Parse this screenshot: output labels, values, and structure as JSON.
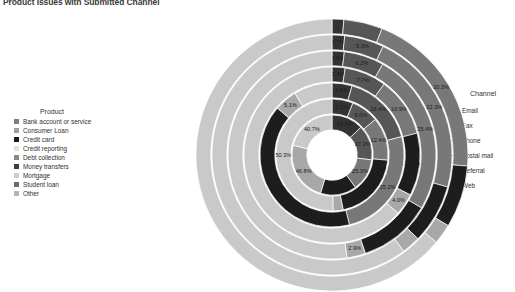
{
  "title": "Product Issues with Submitted Channel",
  "product_legend": {
    "header": "Product",
    "items": [
      {
        "label": "Bank account or service",
        "color": "#7c7c7c"
      },
      {
        "label": "Consumer Loan",
        "color": "#9e9e9e"
      },
      {
        "label": "Credit card",
        "color": "#1a1a1a"
      },
      {
        "label": "Credit reporting",
        "color": "#e2e2e2"
      },
      {
        "label": "Debt collection",
        "color": "#8a8a8a"
      },
      {
        "label": "Money transfers",
        "color": "#3f3f3f"
      },
      {
        "label": "Mortgage",
        "color": "#cfcfcf"
      },
      {
        "label": "Student loan",
        "color": "#6b6b6b"
      },
      {
        "label": "Other",
        "color": "#b5b5b5"
      }
    ]
  },
  "channel_legend": {
    "header": "Channel",
    "items": [
      {
        "label": "Email",
        "color": "#333333"
      },
      {
        "label": "Fax",
        "color": "#565656"
      },
      {
        "label": "Phone",
        "color": "#787878"
      },
      {
        "label": "Postal mail",
        "color": "#1d1d1d"
      },
      {
        "label": "Referral",
        "color": "#a8a8a8"
      },
      {
        "label": "Web",
        "color": "#c9c9c9"
      }
    ]
  },
  "chart_data": {
    "type": "pie",
    "variant": "nested-donut-sunburst",
    "title": "Product Issues with Submitted Channel",
    "legend_position": "left-and-right",
    "grid": false,
    "value_unit": "percent",
    "ring_label": "Product",
    "segment_label": "Channel",
    "channels": [
      "Email",
      "Fax",
      "Phone",
      "Postal mail",
      "Referral",
      "Web"
    ],
    "channel_colors": [
      "#333333",
      "#565656",
      "#787878",
      "#1d1d1d",
      "#a8a8a8",
      "#c9c9c9"
    ],
    "rings": [
      {
        "product": "Bank account or service",
        "ring_index": 0,
        "radius_outer": 136,
        "values": [
          1.4,
          4.6,
          20.3,
          7.4,
          2.4,
          63.9
        ],
        "labels": [
          "",
          "",
          "20.3%",
          "7.4%",
          "",
          ""
        ]
      },
      {
        "product": "Consumer Loan",
        "ring_index": 1,
        "radius_outer": 120,
        "values": [
          1.7,
          5.3,
          22.3,
          8.0,
          2.5,
          60.2
        ],
        "labels": [
          "1.7%",
          "5.3%",
          "22.3%",
          "8.0%",
          "",
          ""
        ]
      },
      {
        "product": "Credit card",
        "ring_index": 2,
        "radius_outer": 104,
        "values": [
          1.9,
          6.2,
          25.4,
          11.3,
          2.9,
          52.3
        ],
        "labels": [
          "1.9%",
          "6.2%",
          "25.4%",
          "11.3%",
          "2.9%",
          ""
        ]
      },
      {
        "product": "Credit reporting",
        "ring_index": 3,
        "radius_outer": 88,
        "values": [
          2.4,
          7.7,
          10.9,
          11.5,
          4.0,
          63.5
        ],
        "labels": [
          "2.4%",
          "7.7%",
          "10.9%",
          "11.5%",
          "4.0%",
          ""
        ]
      },
      {
        "product": "Debt collection",
        "ring_index": 4,
        "radius_outer": 72,
        "values": [
          4.5,
          16.4,
          25.2,
          40.2,
          5.1,
          8.6
        ],
        "labels": [
          "4.5%",
          "16.4%",
          "25.2%",
          "40.2%",
          "5.1%",
          ""
        ]
      },
      {
        "product": "Money transfers",
        "ring_index": 5,
        "radius_outer": 56,
        "values": [
          6.1,
          8.0,
          12.4,
          20.3,
          2.9,
          50.3
        ],
        "labels": [
          "6.1%",
          "8.0%",
          "12.4%",
          "20.3%",
          "",
          "50.3%"
        ]
      },
      {
        "product": "Mortgage",
        "ring_index": 6,
        "radius_outer": 40,
        "values": [
          24.8,
          27.2,
          25.3,
          28.1,
          46.8,
          40.7
        ],
        "labels": [
          "24.8%",
          "27.2%",
          "25.3%",
          "28.1%",
          "46.8%",
          "40.7%"
        ]
      }
    ],
    "all_value_labels": [
      "6.2%",
      "16.4%",
      "5.3%",
      "25.4%",
      "2.9%",
      "22.3%",
      "10.9%",
      "11.3%",
      "11.5%",
      "40.2%",
      "8.0%",
      "2.4%",
      "20.3%",
      "7.7%",
      "6.1%",
      "20.3%",
      "1.7%",
      "2.4%",
      "4.5%",
      "1.9%",
      "25.2%",
      "24.8%",
      "27.2%",
      "4.0%",
      "50.3%",
      "25.3%",
      "12.4%",
      "5.1%",
      "28.1%",
      "46.8%",
      "40.7%"
    ]
  }
}
